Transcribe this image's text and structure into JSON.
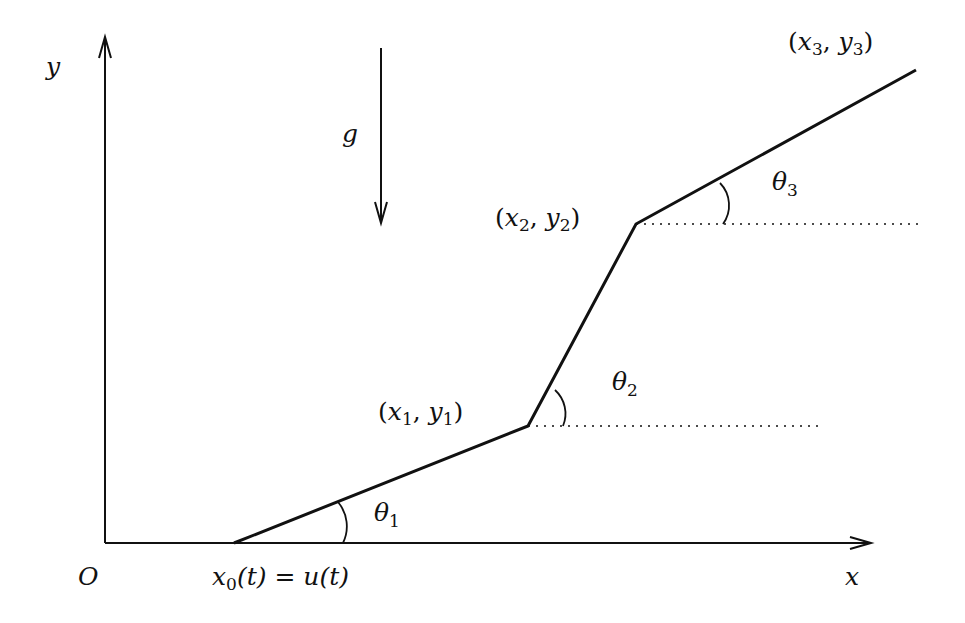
{
  "diagram": {
    "axes": {
      "x_label": "x",
      "y_label": "y",
      "origin_label": "O"
    },
    "gravity_label": "g",
    "base_label": {
      "x": "x",
      "sub": "0",
      "rest": "(t) = u(t)"
    },
    "points": [
      {
        "id": "p1",
        "var_x": "x",
        "sub_x": "1",
        "var_y": "y",
        "sub_y": "1"
      },
      {
        "id": "p2",
        "var_x": "x",
        "sub_x": "2",
        "var_y": "y",
        "sub_y": "2"
      },
      {
        "id": "p3",
        "var_x": "x",
        "sub_x": "3",
        "var_y": "y",
        "sub_y": "3"
      }
    ],
    "angles": [
      {
        "symbol": "θ",
        "sub": "1"
      },
      {
        "symbol": "θ",
        "sub": "2"
      },
      {
        "symbol": "θ",
        "sub": "3"
      }
    ],
    "colors": {
      "stroke": "#111111",
      "background": "#ffffff"
    }
  }
}
